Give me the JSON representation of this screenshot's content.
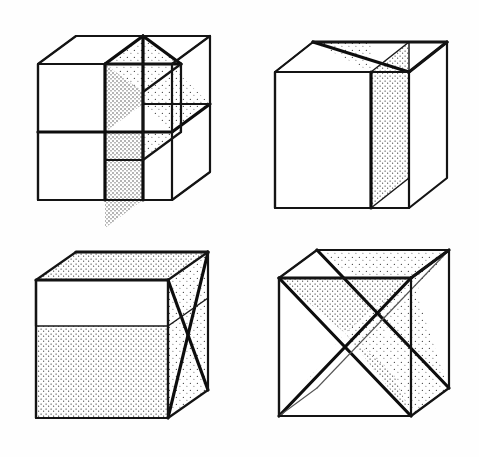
{
  "sheet": {
    "title": "Cube dissection figures",
    "background_color": "#fefefe",
    "ink_color": "#111111",
    "width": 479,
    "height": 457,
    "layout": "2x2 grid of line-drawn cubes",
    "caption": ""
  },
  "figures": [
    {
      "id": "figure-top-left",
      "label": "Cube divided into eight octants",
      "description": "Axonometric cube split by three mutually perpendicular internal planes forming eight equal cubical cells; one octant removed at upper left and the interior partition walls are stippled.",
      "position": "top-left",
      "internal_planes": 3,
      "shading": "stipple",
      "cells": 8
    },
    {
      "id": "figure-top-right",
      "label": "Cube with single diagonal partition",
      "description": "Axonometric cube containing one vertical plane on a face diagonal, stippled, meeting the top face along its diagonals.",
      "position": "top-right",
      "internal_planes": 1,
      "shading": "stipple",
      "cells": 2
    },
    {
      "id": "figure-bottom-left",
      "label": "Cube with oblique plane and crossed right face",
      "description": "Axonometric cube containing a slanted interior plane running from the upper rear edge to the lower front edge, stippled, with crossing diagonals drawn on the right-hand face.",
      "position": "bottom-left",
      "internal_planes": 2,
      "shading": "stipple",
      "cells": 3
    },
    {
      "id": "figure-bottom-right",
      "label": "Cube with two crossing diagonal planes",
      "description": "Axonometric cube containing two intersecting diagonal planes that meet along the body centre forming an X, both stippled.",
      "position": "bottom-right",
      "internal_planes": 2,
      "shading": "stipple",
      "cells": 4
    }
  ],
  "geometry": {
    "projection": "oblique axonometric",
    "depth_dx": 38,
    "depth_dy": -23,
    "cube_side_px": 118
  },
  "palette": {
    "paper": "#fefefe",
    "line": "#111111",
    "stipple": "#3a3a3a",
    "thin_line": "#555555"
  }
}
